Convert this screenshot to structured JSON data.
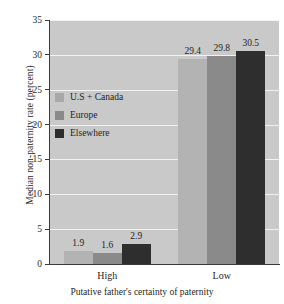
{
  "chart_data": {
    "type": "bar",
    "title": "",
    "xlabel": "Putative father's certainty of paternity",
    "ylabel": "Median non-paternity rate (percent)",
    "categories": [
      "High",
      "Low"
    ],
    "series": [
      {
        "name": "U.S + Canada",
        "values": [
          1.9,
          29.4
        ],
        "color": "#b3b3b3"
      },
      {
        "name": "Europe",
        "values": [
          1.6,
          29.8
        ],
        "color": "#8a8a8a"
      },
      {
        "name": "Elsewhere",
        "values": [
          2.9,
          30.5
        ],
        "color": "#2e2e2e"
      }
    ],
    "ylim": [
      0,
      35
    ],
    "yticks": [
      0,
      5,
      10,
      15,
      20,
      25,
      30,
      35
    ],
    "ytick_labels": [
      "0",
      "5",
      "10",
      "15",
      "20",
      "25",
      "30",
      "35"
    ],
    "data_labels": [
      [
        "1.9",
        "1.6",
        "2.9"
      ],
      [
        "29.4",
        "29.8",
        "30.5"
      ]
    ],
    "grid": true,
    "grid_color": "#f2f2f2",
    "plot_background": "#c9c9c9",
    "legend_position": "inside-left"
  },
  "legend": {
    "items": [
      {
        "label": "U.S + Canada"
      },
      {
        "label": "Europe"
      },
      {
        "label": "Elsewhere"
      }
    ]
  },
  "axes": {
    "y_title": "Median non-paternity rate (percent)",
    "x_title": "Putative father's certainty of paternity",
    "x_categories": [
      "High",
      "Low"
    ]
  }
}
